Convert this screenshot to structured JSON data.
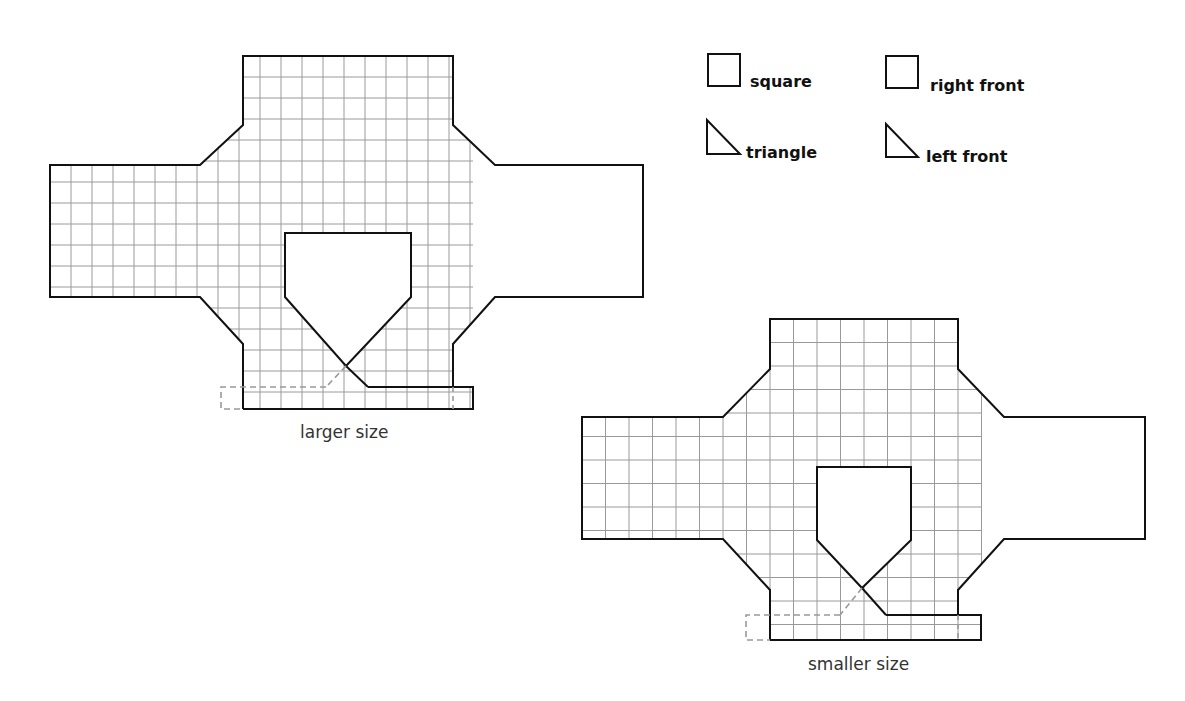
{
  "legend": {
    "items": [
      {
        "shape": "square-icon",
        "label": "square"
      },
      {
        "shape": "triangle-icon",
        "label": "triangle"
      },
      {
        "shape": "square-icon",
        "label": "right front"
      },
      {
        "shape": "triangle-icon",
        "label": "left front"
      }
    ]
  },
  "diagrams": [
    {
      "caption": "larger size"
    },
    {
      "caption": "smaller size"
    }
  ],
  "colors": {
    "outline": "#111111",
    "grid": "#9a9a9a",
    "dashed": "#999999"
  }
}
